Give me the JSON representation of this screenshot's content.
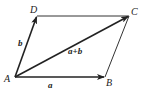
{
  "diagram": {
    "type": "parallelogram-vector-addition",
    "points": {
      "A": {
        "label": "A",
        "x": 15,
        "y": 77
      },
      "B": {
        "label": "B",
        "x": 105,
        "y": 77
      },
      "C": {
        "label": "C",
        "x": 129,
        "y": 16
      },
      "D": {
        "label": "D",
        "x": 37,
        "y": 16
      }
    },
    "vectors": [
      {
        "from": "A",
        "to": "B",
        "label": "a"
      },
      {
        "from": "A",
        "to": "D",
        "label": "b"
      },
      {
        "from": "A",
        "to": "C",
        "label": "a+b"
      }
    ],
    "edges": [
      {
        "from": "D",
        "to": "C"
      },
      {
        "from": "B",
        "to": "C"
      }
    ],
    "colors": {
      "stroke": "#222222",
      "background": "#ffffff"
    }
  }
}
